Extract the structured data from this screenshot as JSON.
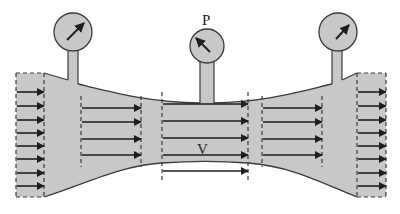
{
  "diagram": {
    "labels": {
      "pressure": "P",
      "velocity": "V"
    },
    "colors": {
      "fluid": "#c8c8c8",
      "outline": "#3a3a3a",
      "arrow": "#1e1e1e",
      "background": "#ffffff"
    },
    "gauges": [
      {
        "id": "gauge-left",
        "cx": 73,
        "cy": 32,
        "r": 19,
        "needle_dir": "up-right"
      },
      {
        "id": "gauge-middle",
        "cx": 207,
        "cy": 46,
        "r": 17,
        "needle_dir": "up-left"
      },
      {
        "id": "gauge-right",
        "cx": 338,
        "cy": 32,
        "r": 19,
        "needle_dir": "up-right"
      }
    ],
    "sections": [
      {
        "id": "inlet",
        "x1": 16,
        "x2": 44,
        "arrows_y": [
          92,
          106,
          120,
          133,
          146,
          159,
          173,
          186
        ]
      },
      {
        "id": "converging",
        "x1": 81,
        "x2": 141,
        "arrows_y": [
          108,
          122,
          139,
          155
        ]
      },
      {
        "id": "throat",
        "x1": 162,
        "x2": 248,
        "arrows_y": [
          104,
          121,
          138,
          155,
          171
        ]
      },
      {
        "id": "diverging",
        "x1": 262,
        "x2": 322,
        "arrows_y": [
          108,
          122,
          139,
          155
        ]
      },
      {
        "id": "outlet",
        "x1": 357,
        "x2": 386,
        "arrows_y": [
          92,
          106,
          120,
          133,
          146,
          159,
          173,
          186
        ]
      }
    ]
  }
}
